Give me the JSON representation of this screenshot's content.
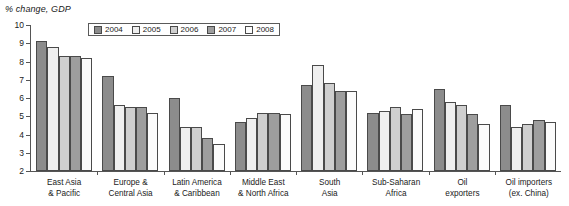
{
  "chart_data": {
    "type": "bar",
    "title": "",
    "ylabel": "% change, GDP",
    "xlabel": "",
    "ylim": [
      2,
      10
    ],
    "yticks": [
      2,
      3,
      4,
      5,
      6,
      7,
      8,
      9,
      10
    ],
    "ytick_labels": [
      "2",
      "3",
      "4",
      "5",
      "6",
      "7",
      "8",
      "9",
      "10"
    ],
    "grid": false,
    "legend_position": "top-left-inside",
    "categories": [
      "East Asia\n& Pacific",
      "Europe &\nCentral Asia",
      "Latin America\n& Caribbean",
      "Middle East\n& North Africa",
      "South\nAsia",
      "Sub-Saharan\nAfrica",
      "Oil\nexporters",
      "Oil importers\n(ex. China)"
    ],
    "series": [
      {
        "name": "2004",
        "color": "#8c8c8c",
        "values": [
          9.1,
          7.2,
          6.0,
          4.7,
          6.7,
          5.2,
          6.5,
          5.6
        ]
      },
      {
        "name": "2005",
        "color": "#efefef",
        "values": [
          8.8,
          5.6,
          4.4,
          4.9,
          7.8,
          5.3,
          5.8,
          4.4
        ]
      },
      {
        "name": "2006",
        "color": "#cfcfcf",
        "values": [
          8.3,
          5.5,
          4.4,
          5.2,
          6.8,
          5.5,
          5.6,
          4.6
        ]
      },
      {
        "name": "2007",
        "color": "#9e9e9e",
        "values": [
          8.3,
          5.5,
          3.8,
          5.2,
          6.4,
          5.1,
          5.1,
          4.8
        ]
      },
      {
        "name": "2008",
        "color": "#fbfbfb",
        "values": [
          8.2,
          5.2,
          3.5,
          5.1,
          6.4,
          5.4,
          4.6,
          4.7
        ]
      }
    ]
  }
}
